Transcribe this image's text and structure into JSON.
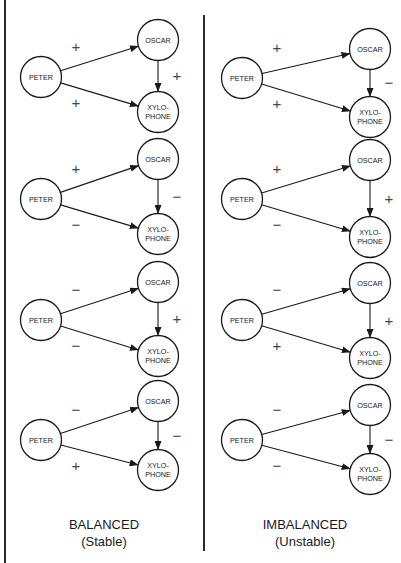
{
  "labels": {
    "peter": "PETER",
    "oscar": "OSCAR",
    "xylo_line1": "XYLO-",
    "xylo_line2": "PHONE"
  },
  "columns": [
    {
      "title": "BALANCED",
      "subtitle": "(Stable)",
      "triads": [
        {
          "peter": [
            41,
            77
          ],
          "oscar": [
            158,
            40
          ],
          "xylo": [
            158,
            112
          ],
          "signs": {
            "peter_oscar": "+",
            "oscar_xylo": "+",
            "peter_xylo": "+"
          }
        },
        {
          "peter": [
            41,
            199
          ],
          "oscar": [
            158,
            159
          ],
          "xylo": [
            158,
            234
          ],
          "signs": {
            "peter_oscar": "+",
            "oscar_xylo": "−",
            "peter_xylo": "−"
          }
        },
        {
          "peter": [
            41,
            320
          ],
          "oscar": [
            158,
            282
          ],
          "xylo": [
            158,
            356
          ],
          "signs": {
            "peter_oscar": "−",
            "oscar_xylo": "+",
            "peter_xylo": "−"
          }
        },
        {
          "peter": [
            41,
            440
          ],
          "oscar": [
            158,
            401
          ],
          "xylo": [
            158,
            470
          ],
          "signs": {
            "peter_oscar": "−",
            "oscar_xylo": "−",
            "peter_xylo": "+"
          }
        }
      ]
    },
    {
      "title": "IMBALANCED",
      "subtitle": "(Unstable)",
      "triads": [
        {
          "peter": [
            242,
            78
          ],
          "oscar": [
            370,
            49
          ],
          "xylo": [
            370,
            117
          ],
          "signs": {
            "peter_oscar": "+",
            "oscar_xylo": "−",
            "peter_xylo": "+"
          }
        },
        {
          "peter": [
            242,
            199
          ],
          "oscar": [
            370,
            160
          ],
          "xylo": [
            370,
            237
          ],
          "signs": {
            "peter_oscar": "+",
            "oscar_xylo": "+",
            "peter_xylo": "−"
          }
        },
        {
          "peter": [
            242,
            320
          ],
          "oscar": [
            370,
            283
          ],
          "xylo": [
            370,
            358
          ],
          "signs": {
            "peter_oscar": "−",
            "oscar_xylo": "+",
            "peter_xylo": "+"
          }
        },
        {
          "peter": [
            242,
            440
          ],
          "oscar": [
            370,
            405
          ],
          "xylo": [
            370,
            474
          ],
          "signs": {
            "peter_oscar": "−",
            "oscar_xylo": "−",
            "peter_xylo": "−"
          }
        }
      ]
    }
  ],
  "style": {
    "line_color": "#1a1a1a",
    "sign_color": "#444444",
    "background": "#ffffff"
  }
}
